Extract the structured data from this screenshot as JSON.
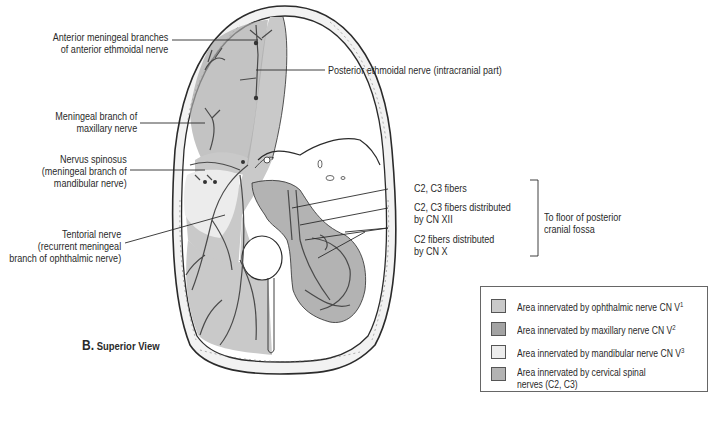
{
  "figure": {
    "caption_letter": "B.",
    "caption_text": "Superior View"
  },
  "labels_left": {
    "anterior_meningeal": [
      "Anterior meningeal branches",
      "of anterior ethmoidal nerve"
    ],
    "meningeal_maxillary": [
      "Meningeal branch of",
      "maxillary nerve"
    ],
    "nervus_spinosus": [
      "Nervus spinosus",
      "(meningeal branch of",
      "mandibular nerve)"
    ],
    "tentorial": [
      "Tentorial nerve",
      "(recurrent meningeal",
      "branch of ophthalmic nerve)"
    ]
  },
  "labels_right": {
    "posterior_ethmoidal": "Posterior ethmoidal nerve (intracranial part)",
    "c2c3_fibers": "C2, C3 fibers",
    "c2c3_cn12": [
      "C2, C3 fibers distributed",
      "by CN XII"
    ],
    "c2_cn10": [
      "C2 fibers distributed",
      "by CN X"
    ],
    "bracket_target": [
      "To floor of posterior",
      "cranial fossa"
    ]
  },
  "legend": {
    "items": [
      {
        "text": "Area innervated by ophthalmic nerve CN V",
        "sup": "1",
        "color": "#c9c9c9"
      },
      {
        "text": "Area innervated by maxillary nerve CN V",
        "sup": "2",
        "color": "#a3a3a3"
      },
      {
        "text": "Area innervated by mandibular nerve CN V",
        "sup": "3",
        "color": "#ececec"
      },
      {
        "text": "Area innervated by cervical spinal",
        "text2": "nerves (C2, C3)",
        "sup": "",
        "color": "#b3b3b3"
      }
    ]
  },
  "colors": {
    "ophthalmic": "#c9c9c9",
    "maxillary": "#a3a3a3",
    "mandibular": "#ececec",
    "cervical": "#b3b3b3",
    "outline": "#2b2b2b",
    "bone": "#f2f2f2"
  }
}
